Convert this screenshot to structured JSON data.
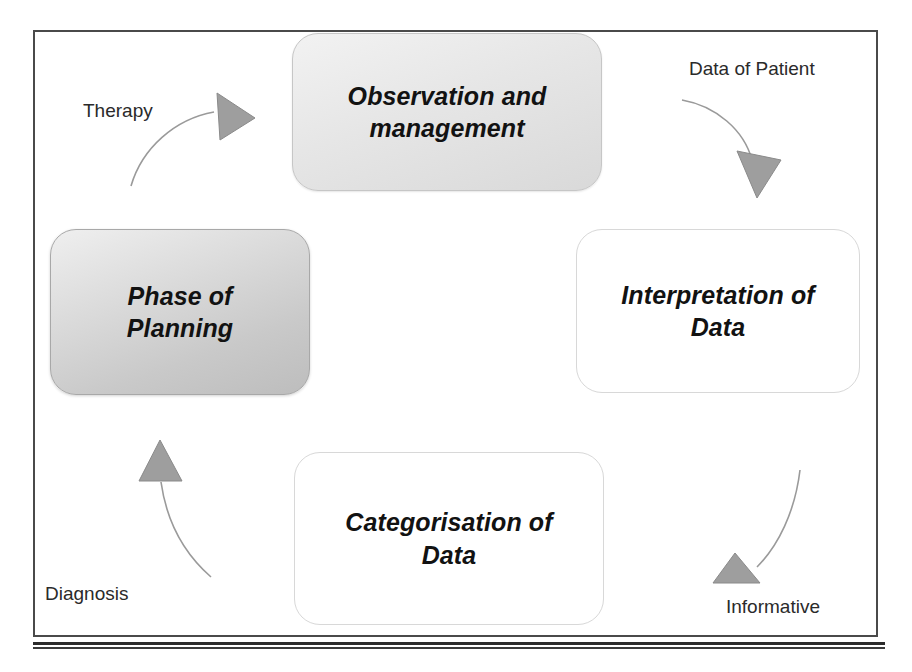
{
  "diagram": {
    "frame": {
      "style": "rectangular-border"
    },
    "colors": {
      "node_fill_light": "#e6e6e6",
      "node_fill_dark": "#c9c9c9",
      "node_fill_white": "#ffffff",
      "arrow_fill": "#9e9e9e",
      "arrow_stroke": "#9a9a9a",
      "text": "#121212",
      "frame_border": "#4a4a4a"
    },
    "nodes": [
      {
        "id": "observation",
        "label": "Observation and\nmanagement",
        "position": "top",
        "fill": "gradient-grey"
      },
      {
        "id": "interpretation",
        "label": "Interpretation of\nData",
        "position": "right",
        "fill": "white"
      },
      {
        "id": "categorisation",
        "label": "Categorisation of\nData",
        "position": "bottom",
        "fill": "white"
      },
      {
        "id": "planning",
        "label": "Phase of\nPlanning",
        "position": "left",
        "fill": "gradient-grey-dark"
      }
    ],
    "edges": [
      {
        "id": "planning-to-observation",
        "label": "Therapy",
        "from": "planning",
        "to": "observation",
        "direction": "right"
      },
      {
        "id": "observation-to-interpretation",
        "label": "Data of Patient",
        "from": "observation",
        "to": "interpretation",
        "direction": "down"
      },
      {
        "id": "categorisation-to-planning",
        "label": "Diagnosis",
        "from": "categorisation",
        "to": "planning",
        "direction": "up"
      },
      {
        "id": "interpretation-to-categorisation",
        "label": "Informative",
        "from": "interpretation",
        "to": "categorisation",
        "direction": "left"
      }
    ]
  }
}
